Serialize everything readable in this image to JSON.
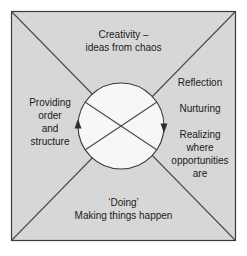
{
  "figure": {
    "colors": {
      "page_background": "#ffffff",
      "square_fill": "#d7d7d7",
      "circle_fill": "#f7f7f7",
      "line": "#3a3a3a",
      "text": "#1a1a1a"
    },
    "geometry": {
      "square": {
        "x": 11,
        "y": 11,
        "width": 225,
        "height": 230
      },
      "circle": {
        "cx": 121,
        "cy": 126,
        "r": 43
      },
      "diagonals": [
        "top-left-to-bottom-right",
        "top-right-to-bottom-left"
      ],
      "arrows": [
        {
          "name": "left-arrow",
          "x": 78,
          "y": 126,
          "direction": "up"
        },
        {
          "name": "right-arrow",
          "x": 164,
          "y": 126,
          "direction": "down"
        }
      ]
    },
    "quadrants": {
      "top": {
        "name": "creativity",
        "text": "Creativity –\nideas from chaos"
      },
      "left": {
        "name": "providing-order-and-structure",
        "text": "Providing\norder\nand\nstructure"
      },
      "right": {
        "name": "reflection-nurturing-realizing",
        "line_1": "Reflection",
        "line_2": "Nurturing",
        "line_3": "Realizing\nwhere\nopportunities\nare"
      },
      "bottom": {
        "name": "doing",
        "text": "‘Doing’\nMaking things happen"
      }
    }
  }
}
